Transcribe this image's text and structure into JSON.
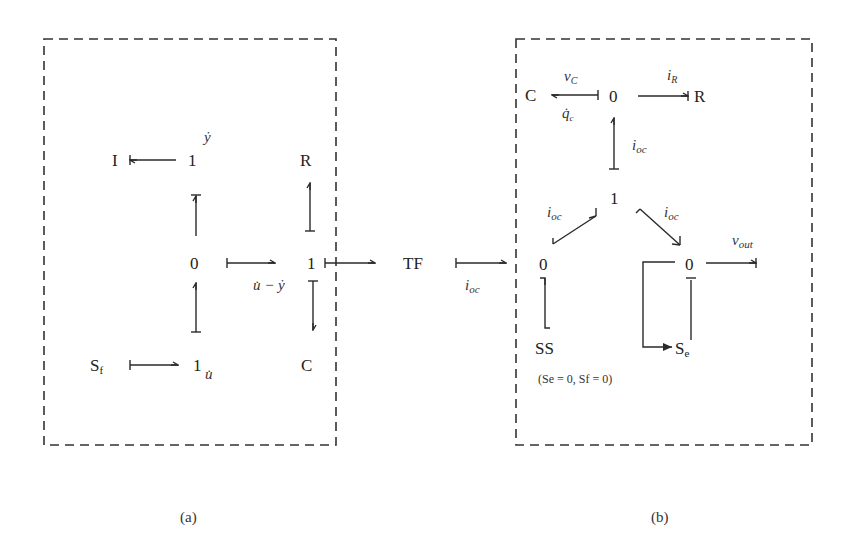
{
  "figure": {
    "panel_a": {
      "caption": "(a)",
      "nodes": {
        "I": "I",
        "one_top": "1",
        "R": "R",
        "zero_mid": "0",
        "one_right": "1",
        "Sf": "S",
        "Sf_sub": "f",
        "one_bottom": "1",
        "C": "C"
      },
      "labels": {
        "ydot": "ẏ",
        "udot": "u̇",
        "u_minus_y": "u̇ − ẏ"
      }
    },
    "link": {
      "TF": "TF",
      "ioc": "i",
      "ioc_sub": "oc"
    },
    "panel_b": {
      "caption": "(b)",
      "nodes": {
        "C": "C",
        "zero_top": "0",
        "R": "R",
        "one_mid": "1",
        "zero_left": "0",
        "zero_right": "0",
        "SS": "SS",
        "Se": "S",
        "Se_sub": "e"
      },
      "labels": {
        "vC": "v",
        "vC_sub": "C",
        "qc": "q̇",
        "qc_sub": "c",
        "iR": "i",
        "iR_sub": "R",
        "ioc_vertical": "i",
        "ioc_left": "i",
        "ioc_right": "i",
        "ioc_sub": "oc",
        "vout": "v",
        "vout_sub": "out"
      },
      "note": "(Se = 0, Sf = 0)"
    }
  }
}
